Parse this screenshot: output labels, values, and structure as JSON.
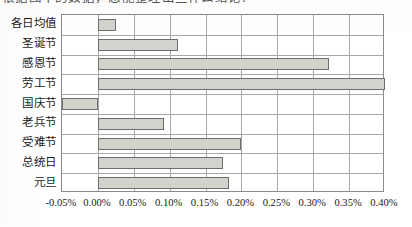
{
  "page": {
    "cut_off_heading_fragment": "根据图中的数据，您能整理出些什么结论？"
  },
  "chart_data": {
    "type": "bar",
    "orientation": "horizontal",
    "title": "",
    "subtitle": "",
    "xlabel": "",
    "ylabel": "",
    "grid": true,
    "legend": null,
    "categories": [
      "各日均值",
      "圣诞节",
      "感恩节",
      "劳工节",
      "国庆节",
      "老兵节",
      "受难节",
      "总统日",
      "元旦"
    ],
    "values": [
      0.025,
      0.111,
      0.322,
      0.4,
      -0.05,
      0.092,
      0.199,
      0.174,
      0.182
    ],
    "value_unit": "%",
    "xlim": [
      -0.05,
      0.4
    ],
    "xticks": [
      -0.05,
      0.0,
      0.05,
      0.1,
      0.15,
      0.2,
      0.25,
      0.3,
      0.35,
      0.4
    ],
    "xticklabels": [
      "-0.05%",
      "0.00%",
      "0.05%",
      "0.10%",
      "0.15%",
      "0.20%",
      "0.25%",
      "0.30%",
      "0.35%",
      "0.40%"
    ],
    "colors": {
      "bar_fill": "#d4d2cc",
      "bar_border": "#6e6e6e",
      "gridline": "#a8a8a8",
      "axis_frame": "#8a8a8a",
      "text": "#1a1a1a",
      "background": "#ffffff"
    }
  }
}
